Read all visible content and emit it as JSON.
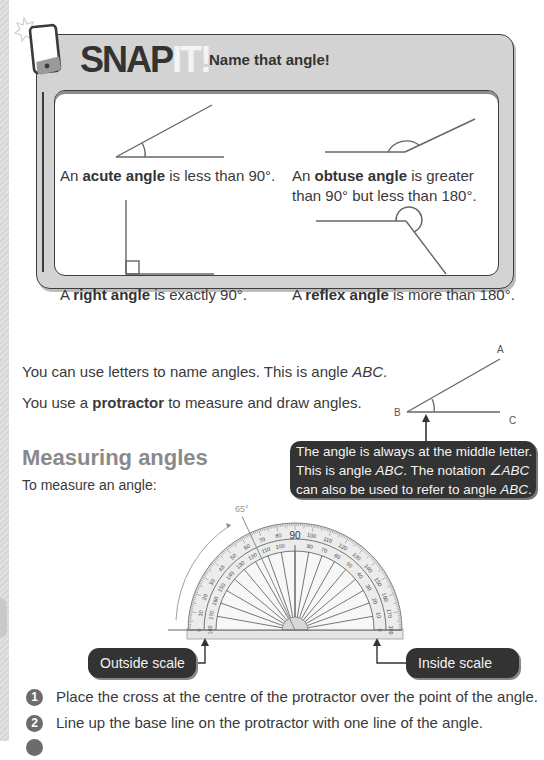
{
  "snap_it": {
    "logo_main": "SNAP",
    "logo_accent": "IT!",
    "subtitle": "Name that angle!",
    "cards": [
      {
        "prefix": "An ",
        "term": "acute angle",
        "rest": " is less than 90°."
      },
      {
        "prefix": "An ",
        "term": "obtuse angle",
        "rest": " is greater",
        "line2": "than 90° but less than 180°."
      },
      {
        "prefix": "A ",
        "term": "right angle",
        "rest": " is exactly 90°."
      },
      {
        "prefix": "A ",
        "term": "reflex angle",
        "rest": " is more than 180°."
      }
    ]
  },
  "intro": {
    "line1_text": "You can use letters to name angles. This is angle ",
    "line1_italic": "ABC",
    "line1_end": ".",
    "line2_prefix": "You use a ",
    "line2_bold": "protractor",
    "line2_rest": " to measure and draw angles."
  },
  "abc_diagram": {
    "labels": {
      "a": "A",
      "b": "B",
      "c": "C"
    }
  },
  "tooltip": {
    "line1": "The angle is always at the middle letter.",
    "line2_a": "This is angle ",
    "line2_i": "ABC",
    "line2_b": ". The notation ",
    "line2_i2": "∠ABC",
    "line3_a": "can also be used to refer to angle ",
    "line3_i": "ABC",
    "line3_b": "."
  },
  "section": {
    "heading": "Measuring angles",
    "intro": "To measure an angle:"
  },
  "protractor": {
    "angle_label": "65°",
    "center_label": "90",
    "outer_labels": [
      "0",
      "10",
      "20",
      "30",
      "40",
      "50",
      "60",
      "70",
      "80",
      "100",
      "110",
      "120",
      "130",
      "140",
      "150",
      "160",
      "170",
      "180"
    ],
    "inner_labels": [
      "180",
      "170",
      "160",
      "150",
      "140",
      "130",
      "120",
      "110",
      "100",
      "80",
      "70",
      "60",
      "50",
      "40",
      "30",
      "20",
      "10",
      "0"
    ],
    "callouts": {
      "outside": "Outside scale",
      "inside": "Inside scale"
    }
  },
  "steps": [
    {
      "num": "1",
      "text": "Place the cross at the centre of the protractor over the point of the angle."
    },
    {
      "num": "2",
      "text": "Line up the base line on the protractor with one line of the angle."
    }
  ],
  "colors": {
    "frame": "#d3d3d3",
    "dark_box": "#333333",
    "heading": "#8a8a8a"
  }
}
